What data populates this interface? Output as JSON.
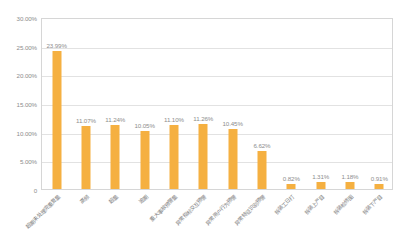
{
  "chart_data": {
    "type": "bar",
    "title": "",
    "subtitle": "",
    "xlabel": "",
    "ylabel": "",
    "ylim": [
      0,
      30
    ],
    "yticks": [
      "0",
      "5.00%",
      "10.00%",
      "15.00%",
      "20.00%",
      "25.00%",
      "30.00%"
    ],
    "ytick_values": [
      0,
      5,
      10,
      15,
      20,
      25,
      30
    ],
    "grid": true,
    "legend": false,
    "legend_position": "none",
    "bar_color": "#f5b041",
    "gridline_color": "#e2e2e2",
    "axis_text_color": "#8d8d8d",
    "categories": [
      "超期未处理完重复量",
      "高频",
      "超量",
      "逾期",
      "重大事故预警量",
      "异常指标交互预警",
      "异常用户行为预警",
      "异常特征识别预警",
      "拆装工日打",
      "拆装上产目",
      "拆装检修图",
      "拆装下产目"
    ],
    "values": [
      23.99,
      11.07,
      11.24,
      10.05,
      11.1,
      11.26,
      10.45,
      6.62,
      0.82,
      1.31,
      1.18,
      0.91
    ],
    "value_labels": [
      "23.99%",
      "11.07%",
      "11.24%",
      "10.05%",
      "11.10%",
      "11.26%",
      "10.45%",
      "6.62%",
      "0.82%",
      "1.31%",
      "1.18%",
      "0.91%"
    ]
  }
}
